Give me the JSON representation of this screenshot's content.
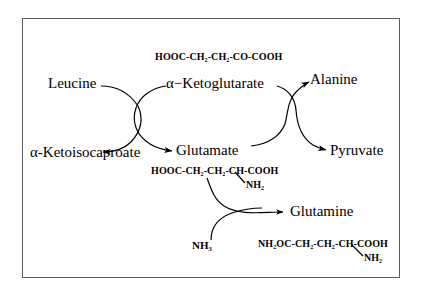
{
  "diagram": {
    "title_border_color": "#5a5a5a",
    "background_color": "#ffffff",
    "ink_color": "#000000",
    "nodes": {
      "leucine": "Leucine",
      "ketoglutarate": "α−Ketoglutarate",
      "alanine": "Alanine",
      "ketoisocaproate": "α-Ketoisocaproate",
      "glutamate": "Glutamate",
      "pyruvate": "Pyruvate",
      "glutamine": "Glutamine"
    },
    "formulas": {
      "ketoglutarate_structure": {
        "main": "HOOC-CH₂-CH₂-CO-COOH"
      },
      "glutamate_structure": {
        "main": "HOOC-CH₂-CH₂-CH-COOH",
        "branch": "NH₂"
      },
      "glutamine_structure": {
        "main": "NH₂OC-CH₂-CH₂-CH-COOH",
        "branch": "NH₂"
      }
    },
    "reactants": {
      "ammonia": "NH₃"
    }
  }
}
